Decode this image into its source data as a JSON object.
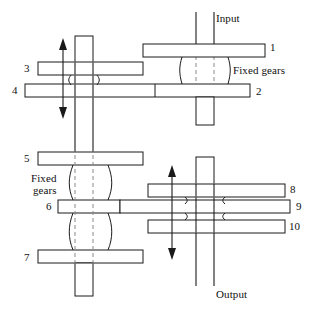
{
  "diagram": {
    "colors": {
      "outline": "#1a1a1a",
      "fill": "#ffffff",
      "centerline": "#8a8a8a",
      "background": "#ffffff"
    },
    "annotations": {
      "input": "Input",
      "output": "Output",
      "fixed_gears_top": "Fixed gears",
      "fixed_gears_left_line1": "Fixed",
      "fixed_gears_left_line2": "gears"
    },
    "gear_labels": [
      {
        "id": "gear-1",
        "text": "1",
        "x": 270,
        "y": 41
      },
      {
        "id": "gear-2",
        "text": "2",
        "x": 256,
        "y": 92
      },
      {
        "id": "gear-3",
        "text": "3",
        "x": 22,
        "y": 63
      },
      {
        "id": "gear-4",
        "text": "4",
        "x": 12,
        "y": 92
      },
      {
        "id": "gear-5",
        "text": "5",
        "x": 22,
        "y": 158
      },
      {
        "id": "gear-6",
        "text": "6",
        "x": 48,
        "y": 208
      },
      {
        "id": "gear-7",
        "text": "7",
        "x": 22,
        "y": 258
      },
      {
        "id": "gear-8",
        "text": "8",
        "x": 290,
        "y": 185
      },
      {
        "id": "gear-9",
        "text": "9",
        "x": 296,
        "y": 208
      },
      {
        "id": "gear-10",
        "text": "10",
        "x": 290,
        "y": 232
      }
    ],
    "shafts": [
      {
        "id": "input-shaft",
        "label": "Input",
        "orientation": "vertical"
      },
      {
        "id": "output-shaft",
        "label": "Output",
        "orientation": "vertical"
      },
      {
        "id": "left-layshaft",
        "orientation": "vertical"
      },
      {
        "id": "right-layshaft",
        "orientation": "vertical"
      }
    ],
    "motion_arrows": [
      {
        "id": "left-shift-arrow",
        "direction": "bidirectional-vertical"
      },
      {
        "id": "right-shift-arrow",
        "direction": "bidirectional-vertical"
      }
    ]
  }
}
